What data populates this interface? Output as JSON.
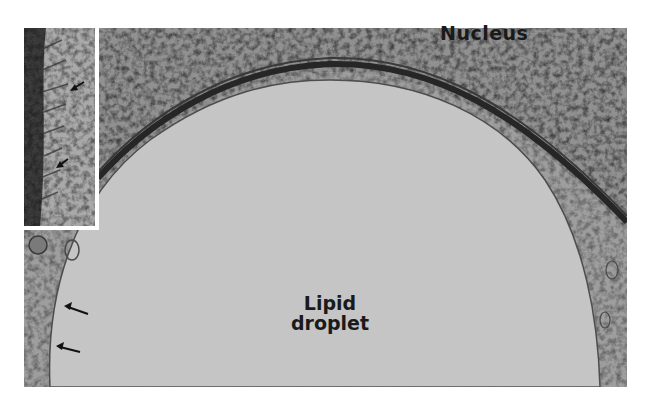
{
  "figure": {
    "type": "transmission electron micrograph",
    "labels": {
      "nucleus": "Nucleus",
      "lipid_line1": "Lipid",
      "lipid_line2": "droplet"
    },
    "inset": {
      "arrow_count": 2,
      "border_color": "#ffffff"
    },
    "main_arrow_count": 2,
    "colors": {
      "background": "#ffffff",
      "nucleus": "#8a8a8a",
      "droplet": "#c4c4c4",
      "membrane": "#2a2a2a",
      "cytoplasm": "#9a9a9a",
      "label_text": "#1a1a1a"
    }
  }
}
